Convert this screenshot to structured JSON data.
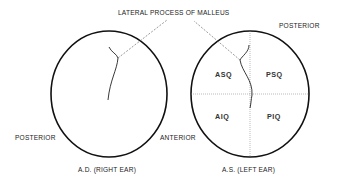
{
  "title_label": "LATERAL PROCESS OF MALLEUS",
  "right_ear": {
    "caption": "A.D. (RIGHT EAR)",
    "left_side_label": "POSTERIOR",
    "right_side_label": "ANTERIOR"
  },
  "left_ear": {
    "caption": "A.S. (LEFT EAR)",
    "top_label": "POSTERIOR",
    "quadrants": {
      "upper_left": "ASQ",
      "upper_right": "PSQ",
      "lower_left": "AIQ",
      "lower_right": "PIQ"
    }
  },
  "colors": {
    "outline": "#111111",
    "dashed": "#555555",
    "text": "#222222"
  }
}
